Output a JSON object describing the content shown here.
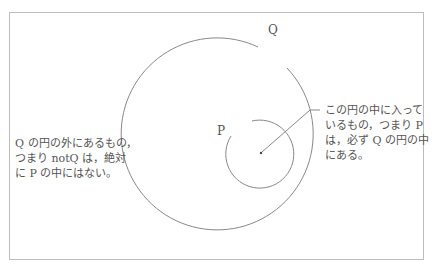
{
  "diagram": {
    "circles": [
      {
        "id": "Q",
        "label": "Q",
        "description": "outer circle"
      },
      {
        "id": "P",
        "label": "P",
        "description": "inner circle"
      }
    ],
    "annotations": {
      "right_note": {
        "line1": "この円の中に入って",
        "line2": "いるもの，つまり P",
        "line3": "は，必ず Q の円の中",
        "line4": "にある。"
      },
      "left_note": {
        "line1": "Q の円の外にあるもの，",
        "line2": "つまり notQ は，絶対",
        "line3": "に P の中にはない。"
      }
    },
    "colors": {
      "stroke": "#888888",
      "frame": "#bdbdbd",
      "text": "#555555"
    }
  }
}
